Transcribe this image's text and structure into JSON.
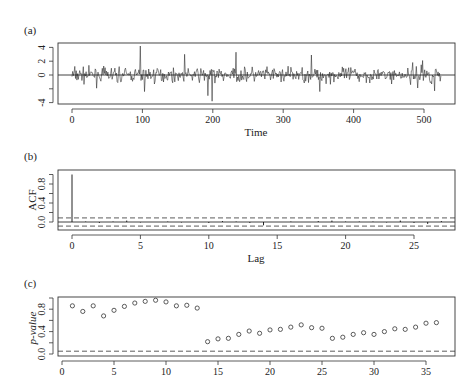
{
  "chart_data": [
    {
      "panel": "(a)",
      "type": "line",
      "title": "",
      "xlabel": "Time",
      "ylabel": "",
      "xlim": [
        -20,
        545
      ],
      "ylim": [
        -4.3,
        4.6
      ],
      "xticks": [
        0,
        100,
        200,
        300,
        400,
        500
      ],
      "yticks": [
        -4,
        -2,
        0,
        2,
        4
      ],
      "ytick_labels": [
        "-4",
        "",
        "0",
        "2",
        "4"
      ],
      "n": 525,
      "hline": 0,
      "notable_points": [
        {
          "x": 97,
          "y": 4.2
        },
        {
          "x": 103,
          "y": -2.4
        },
        {
          "x": 160,
          "y": 3.0
        },
        {
          "x": 193,
          "y": -3.0
        },
        {
          "x": 199,
          "y": -3.8
        },
        {
          "x": 233,
          "y": 3.3
        },
        {
          "x": 340,
          "y": 2.9
        },
        {
          "x": 352,
          "y": -2.4
        },
        {
          "x": 498,
          "y": 2.1
        },
        {
          "x": 515,
          "y": -2.3
        }
      ],
      "note": "Series values approximated; plotted as high-frequency residual-like noise around 0"
    },
    {
      "panel": "(b)",
      "type": "bar",
      "title": "",
      "xlabel": "Lag",
      "ylabel": "ACF",
      "xlim": [
        -1,
        28
      ],
      "ylim": [
        -0.12,
        1.02
      ],
      "xticks": [
        0,
        5,
        10,
        15,
        20,
        25
      ],
      "yticks": [
        0.0,
        0.2,
        0.4,
        0.6,
        0.8,
        1.0
      ],
      "ytick_labels": [
        "0.0",
        "",
        "0.4",
        "",
        "0.8",
        ""
      ],
      "categories": [
        0,
        1,
        2,
        3,
        4,
        5,
        6,
        7,
        8,
        9,
        10,
        11,
        12,
        13,
        14,
        15,
        16,
        17,
        18,
        19,
        20,
        21,
        22,
        23,
        24,
        25,
        26,
        27
      ],
      "values": [
        1.0,
        0.01,
        -0.02,
        0.01,
        0.03,
        -0.01,
        0.0,
        0.01,
        -0.01,
        0.0,
        -0.02,
        0.02,
        0.01,
        -0.02,
        -0.07,
        0.0,
        0.01,
        0.0,
        0.02,
        0.03,
        0.01,
        0.01,
        0.01,
        -0.01,
        0.03,
        -0.02,
        -0.04,
        0.02
      ],
      "confidence_band": 0.086
    },
    {
      "panel": "(c)",
      "type": "scatter",
      "title": "",
      "xlabel": "",
      "ylabel": "p-value",
      "xlim": [
        -1,
        37
      ],
      "ylim": [
        -0.02,
        1.02
      ],
      "xticks": [
        0,
        5,
        10,
        15,
        20,
        25,
        30,
        35
      ],
      "yticks": [
        0.0,
        0.2,
        0.4,
        0.6,
        0.8,
        1.0
      ],
      "ytick_labels": [
        "0.0",
        "",
        "0.4",
        "",
        "0.8",
        ""
      ],
      "x": [
        1,
        2,
        3,
        4,
        5,
        6,
        7,
        8,
        9,
        10,
        11,
        12,
        13,
        14,
        15,
        16,
        17,
        18,
        19,
        20,
        21,
        22,
        23,
        24,
        25,
        26,
        27,
        28,
        29,
        30,
        31,
        32,
        33,
        34,
        35,
        36
      ],
      "values": [
        0.86,
        0.76,
        0.86,
        0.68,
        0.78,
        0.85,
        0.91,
        0.94,
        0.96,
        0.93,
        0.86,
        0.87,
        0.82,
        0.22,
        0.27,
        0.28,
        0.35,
        0.41,
        0.37,
        0.43,
        0.44,
        0.48,
        0.52,
        0.47,
        0.46,
        0.28,
        0.3,
        0.35,
        0.38,
        0.35,
        0.4,
        0.45,
        0.44,
        0.48,
        0.55,
        0.56
      ],
      "reference_line": 0.05
    }
  ],
  "labels": {
    "panel_a": "(a)",
    "panel_b": "(b)",
    "panel_c": "(c)",
    "time_label": "Time",
    "lag_label": "Lag",
    "acf_label": "ACF",
    "pvalue_label": "p-value"
  }
}
